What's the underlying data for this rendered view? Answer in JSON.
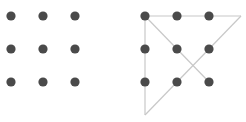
{
  "colors": {
    "dot": "#4a4a4a",
    "line": "#c8c8c8",
    "background": "#ffffff"
  },
  "dot_radius": 4.6,
  "panels": [
    {
      "name": "puzzle",
      "dots": [
        [
          11,
          16
        ],
        [
          43,
          16
        ],
        [
          75,
          16
        ],
        [
          11,
          49
        ],
        [
          43,
          49
        ],
        [
          75,
          49
        ],
        [
          11,
          82
        ],
        [
          43,
          82
        ],
        [
          75,
          82
        ]
      ],
      "lines": []
    },
    {
      "name": "solution",
      "dots": [
        [
          145,
          16
        ],
        [
          177,
          16
        ],
        [
          209,
          16
        ],
        [
          145,
          49
        ],
        [
          177,
          49
        ],
        [
          209,
          49
        ],
        [
          145,
          82
        ],
        [
          177,
          82
        ],
        [
          209,
          82
        ]
      ],
      "lines": [
        [
          [
            145,
            16
          ],
          [
            241,
            16
          ]
        ],
        [
          [
            241,
            16
          ],
          [
            145,
            115
          ]
        ],
        [
          [
            145,
            115
          ],
          [
            145,
            16
          ]
        ],
        [
          [
            145,
            16
          ],
          [
            209,
            82
          ]
        ]
      ]
    }
  ]
}
